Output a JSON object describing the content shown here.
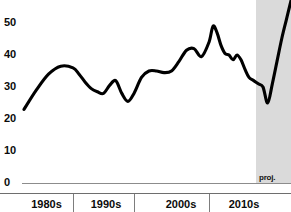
{
  "chart_data": {
    "type": "line",
    "title": "",
    "subtitle": "",
    "xlabel": "",
    "ylabel": "",
    "xlim": [
      1976,
      2019
    ],
    "ylim": [
      0,
      57
    ],
    "grid": false,
    "legend": null,
    "y_ticks": [
      0,
      10,
      20,
      30,
      40,
      50
    ],
    "y_tick_labels": [
      "0",
      "10",
      "20",
      "30",
      "40",
      "50"
    ],
    "x_tick_labels": [
      "1980s",
      "1990s",
      "2000s",
      "2010s"
    ],
    "x_decade_boundaries": [
      1980,
      1990,
      2000,
      2010
    ],
    "annotations": [
      {
        "text": "proj.",
        "x_start": 2013,
        "x_end": 2019,
        "kind": "shaded-forecast-band"
      }
    ],
    "series": [
      {
        "name": "value",
        "color": "#000000",
        "x": [
          1976,
          1977,
          1978,
          1979,
          1980,
          1981,
          1982,
          1983,
          1984,
          1985,
          1986,
          1987,
          1988,
          1989,
          1990,
          1991,
          1992,
          1993,
          1994,
          1995,
          1996,
          1997,
          1998,
          1999,
          2000,
          2001,
          2002,
          2003,
          2004,
          2005,
          2006,
          2007,
          2008,
          2009,
          2010,
          2011,
          2012,
          2013,
          2014,
          2015,
          2016,
          2017,
          2018,
          2019
        ],
        "values": [
          23,
          29,
          34,
          36.5,
          36,
          34,
          31.5,
          29.5,
          28.5,
          28,
          30.5,
          32,
          28,
          25.5,
          28,
          33,
          35,
          35,
          34.5,
          35,
          38,
          41.5,
          42,
          39.5,
          44,
          49,
          47,
          43,
          40.5,
          40,
          38.5,
          40,
          38.5,
          35.5,
          33,
          32,
          31,
          30,
          25,
          31,
          38,
          45,
          51,
          57
        ]
      }
    ]
  },
  "axis": {
    "y_labels": [
      "50",
      "40",
      "30",
      "20",
      "10",
      "0"
    ],
    "x_labels": [
      "1980s",
      "1990s",
      "2000s",
      "2010s"
    ]
  },
  "projection": {
    "label": "proj."
  },
  "colors": {
    "line": "#000000",
    "projection_band": "#d8d8d8",
    "axis": "#8c8c8c",
    "text": "#0b0b0b",
    "background": "#ffffff"
  }
}
